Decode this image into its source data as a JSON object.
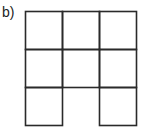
{
  "label": "b)",
  "grid": {
    "rows": 3,
    "cols": 3,
    "line_color": "#2a2a2a",
    "origin": [
      25.5,
      11.5
    ],
    "cell_w": 37,
    "cell_h": 38,
    "missing_cells": [
      [
        2,
        1
      ]
    ],
    "description": "3x3 grid of squares with the bottom-middle square missing (open at the bottom)"
  }
}
